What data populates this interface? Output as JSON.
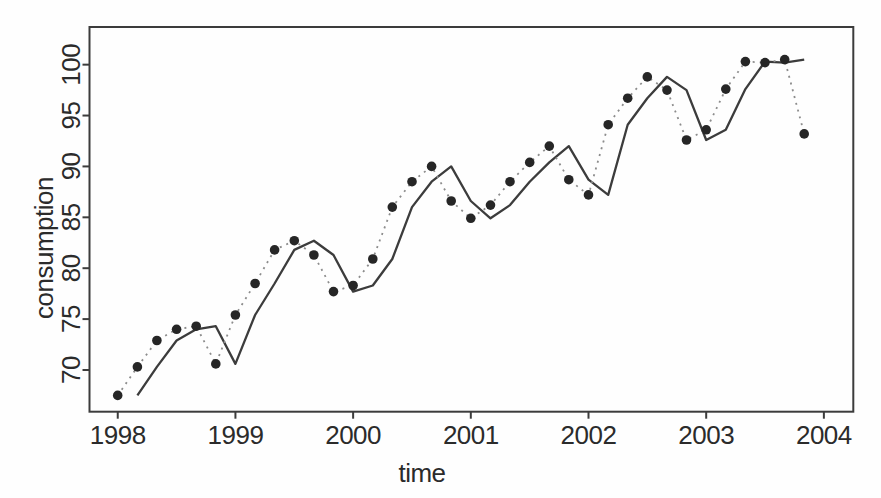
{
  "window": {
    "width": 881,
    "height": 498,
    "background": "#fefefe",
    "text_color": "#2b2b2b",
    "frame_color": "#3c3c3c"
  },
  "chart_data": {
    "type": "line",
    "title": "",
    "xlabel": "time",
    "ylabel": "consumption",
    "xlim": [
      1997.76,
      2004.25
    ],
    "ylim": [
      65.9,
      103.7
    ],
    "x_ticks": [
      1998,
      1999,
      2000,
      2001,
      2002,
      2003,
      2004
    ],
    "y_ticks": [
      70,
      75,
      80,
      85,
      90,
      95,
      100
    ],
    "grid": false,
    "frame": "box",
    "legend": "none",
    "series": [
      {
        "name": "series-dotted-points",
        "style": "dotted-line-with-filled-circle-markers",
        "line_color": "#8c8c8c",
        "marker_color": "#262626",
        "x": [
          1998.0,
          1998.167,
          1998.333,
          1998.5,
          1998.667,
          1998.833,
          1999.0,
          1999.167,
          1999.333,
          1999.5,
          1999.667,
          1999.833,
          2000.0,
          2000.167,
          2000.333,
          2000.5,
          2000.667,
          2000.833,
          2001.0,
          2001.167,
          2001.333,
          2001.5,
          2001.667,
          2001.833,
          2002.0,
          2002.167,
          2002.333,
          2002.5,
          2002.667,
          2002.833,
          2003.0,
          2003.167,
          2003.333,
          2003.5,
          2003.667,
          2003.833
        ],
        "values": [
          67.5,
          70.3,
          72.9,
          74.0,
          74.3,
          70.6,
          75.4,
          78.5,
          81.8,
          82.7,
          81.3,
          77.7,
          78.3,
          80.9,
          86.0,
          88.5,
          90.0,
          86.6,
          84.9,
          86.2,
          88.5,
          90.4,
          92.0,
          88.7,
          87.2,
          94.1,
          96.7,
          98.8,
          97.5,
          92.6,
          93.6,
          97.6,
          100.3,
          100.2,
          100.5,
          93.2
        ]
      },
      {
        "name": "series-solid-line",
        "style": "solid-line-no-markers",
        "line_color": "#3c3c3c",
        "marker_color": null,
        "x": [
          1998.167,
          1998.333,
          1998.5,
          1998.667,
          1998.833,
          1999.0,
          1999.167,
          1999.333,
          1999.5,
          1999.667,
          1999.833,
          2000.0,
          2000.167,
          2000.333,
          2000.5,
          2000.667,
          2000.833,
          2001.0,
          2001.167,
          2001.333,
          2001.5,
          2001.667,
          2001.833,
          2002.0,
          2002.167,
          2002.333,
          2002.5,
          2002.667,
          2002.833,
          2003.0,
          2003.167,
          2003.333,
          2003.5,
          2003.667,
          2003.833
        ],
        "values": [
          67.5,
          70.3,
          72.9,
          74.0,
          74.3,
          70.6,
          75.4,
          78.5,
          81.8,
          82.7,
          81.3,
          77.7,
          78.3,
          80.9,
          86.0,
          88.5,
          90.0,
          86.6,
          84.9,
          86.2,
          88.5,
          90.4,
          92.0,
          88.7,
          87.2,
          94.1,
          96.7,
          98.8,
          97.5,
          92.6,
          93.6,
          97.6,
          100.3,
          100.2,
          100.5
        ]
      }
    ]
  }
}
